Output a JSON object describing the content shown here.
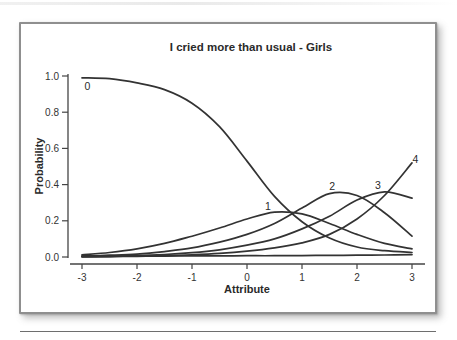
{
  "figure": {
    "background": "#ffffff",
    "card_border_color": "#8f8f8f",
    "rule_color": "#6e6e6e"
  },
  "chart_data": {
    "type": "line",
    "title": "I cried more than usual - Girls",
    "xlabel": "Attribute",
    "ylabel": "Probability",
    "xlim": [
      -3,
      3
    ],
    "ylim": [
      0,
      1
    ],
    "grid": false,
    "legend_position": "none (curves labeled inline)",
    "line_color": "#333333",
    "axis_color": "#444444",
    "x_ticks": [
      -3,
      -2,
      -1,
      0,
      1,
      2,
      3
    ],
    "y_ticks": [
      {
        "value": 0.0,
        "label": "0.0"
      },
      {
        "value": 0.2,
        "label": "0.2"
      },
      {
        "value": 0.4,
        "label": "0.4"
      },
      {
        "value": 0.6,
        "label": "0.6"
      },
      {
        "value": 0.8,
        "label": "0.8"
      },
      {
        "value": 1.0,
        "label": "1.0"
      }
    ],
    "x": [
      -3,
      -2.5,
      -2,
      -1.5,
      -1,
      -0.5,
      0,
      0.5,
      1,
      1.5,
      2,
      2.5,
      3
    ],
    "series": [
      {
        "name": "category-0",
        "label": "0",
        "values": [
          0.99,
          0.985,
          0.962,
          0.925,
          0.85,
          0.72,
          0.53,
          0.335,
          0.195,
          0.105,
          0.055,
          0.035,
          0.025
        ]
      },
      {
        "name": "category-1",
        "label": "1",
        "values": [
          0.012,
          0.025,
          0.045,
          0.075,
          0.115,
          0.16,
          0.21,
          0.248,
          0.238,
          0.185,
          0.125,
          0.075,
          0.045
        ]
      },
      {
        "name": "category-2",
        "label": "2",
        "values": [
          0.006,
          0.01,
          0.016,
          0.03,
          0.05,
          0.082,
          0.125,
          0.185,
          0.27,
          0.35,
          0.34,
          0.245,
          0.115
        ]
      },
      {
        "name": "category-3",
        "label": "3",
        "values": [
          0.002,
          0.004,
          0.008,
          0.014,
          0.024,
          0.04,
          0.065,
          0.1,
          0.155,
          0.225,
          0.315,
          0.36,
          0.325
        ]
      },
      {
        "name": "category-4",
        "label": "4",
        "values": [
          0.001,
          0.002,
          0.004,
          0.007,
          0.012,
          0.02,
          0.032,
          0.05,
          0.078,
          0.125,
          0.21,
          0.34,
          0.52
        ]
      },
      {
        "name": "category-flat-near-zero",
        "label": "",
        "values": [
          0.004,
          0.004,
          0.005,
          0.005,
          0.006,
          0.006,
          0.007,
          0.007,
          0.008,
          0.009,
          0.01,
          0.011,
          0.013
        ]
      }
    ],
    "curve_labels": [
      {
        "text": "0",
        "x": -2.9,
        "y": 0.925
      },
      {
        "text": "1",
        "x": 0.38,
        "y": 0.262
      },
      {
        "text": "2",
        "x": 1.55,
        "y": 0.372
      },
      {
        "text": "3",
        "x": 2.38,
        "y": 0.378
      },
      {
        "text": "4",
        "x": 3.06,
        "y": 0.522
      }
    ]
  }
}
